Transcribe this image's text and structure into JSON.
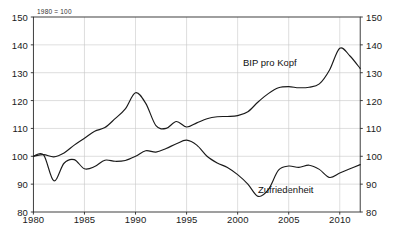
{
  "chart_data": {
    "type": "line",
    "title": "",
    "subtitle": "",
    "note": "1980 = 100",
    "xlabel": "",
    "ylabel": "",
    "xlim": [
      1980,
      2012
    ],
    "ylim": [
      80,
      150
    ],
    "grid": true,
    "legend": "inline-annotations",
    "x_ticks": [
      1980,
      1985,
      1990,
      1995,
      2000,
      2005,
      2010
    ],
    "x_tick_labels": [
      "1980",
      "1985",
      "1990",
      "1995",
      "2000",
      "2005",
      "2010"
    ],
    "y_ticks": [
      80,
      90,
      100,
      110,
      120,
      130,
      140,
      150
    ],
    "y_tick_labels_left": [
      "150",
      "140",
      "130",
      "120",
      "110",
      "100",
      "90",
      "80"
    ],
    "y_tick_labels_right": [
      "150",
      "140",
      "130",
      "120",
      "110",
      "100",
      "90",
      "80"
    ],
    "axis_color": "#2a2a2a",
    "grid_color": "#c8c8c8",
    "line_color": "#1a1a1a",
    "background": "#ffffff",
    "x": [
      1980,
      1981,
      1982,
      1983,
      1984,
      1985,
      1986,
      1987,
      1988,
      1989,
      1990,
      1991,
      1992,
      1993,
      1994,
      1995,
      1996,
      1997,
      1998,
      1999,
      2000,
      2001,
      2002,
      2003,
      2004,
      2005,
      2006,
      2007,
      2008,
      2009,
      2010,
      2011,
      2012
    ],
    "series": [
      {
        "name": "BIP pro Kopf",
        "label": "BIP pro Kopf",
        "label_x": 2003.1,
        "label_y": 131.5,
        "values": [
          100.0,
          100.6,
          99.8,
          101.2,
          104.0,
          106.5,
          109.0,
          110.3,
          113.5,
          117.0,
          122.8,
          119.0,
          111.0,
          110.0,
          112.5,
          110.5,
          112.0,
          113.5,
          114.2,
          114.3,
          114.6,
          116.0,
          119.5,
          122.5,
          124.6,
          125.0,
          124.6,
          124.8,
          126.0,
          131.0,
          138.8,
          136.0,
          131.5
        ]
      },
      {
        "name": "Zufriedenheit",
        "label": "Zufriedenheit",
        "label_x": 2004.3,
        "label_y": 86.5,
        "values": [
          100.0,
          100.5,
          91.2,
          97.5,
          98.8,
          95.5,
          96.3,
          98.6,
          98.2,
          98.5,
          100.0,
          102.0,
          101.5,
          102.8,
          104.5,
          105.8,
          104.0,
          100.0,
          97.6,
          96.0,
          93.4,
          90.0,
          85.6,
          88.0,
          95.0,
          96.5,
          96.0,
          96.8,
          95.3,
          92.4,
          94.0,
          95.5,
          97.0
        ]
      }
    ],
    "series_BIP_pro_Kopf_path_note": "Smooth rising curve: starts 100 in 1980, dips slightly 1982, rises steadily to 1990 reunification peak ~123, drops to ~110 by 1993, small recovery bump 1994 ~112, dip 1995 ~110.5, gradual climb through late 1990s, plateau ~114-115 around 1999-2001, rises to ~125 by 2004-2005, flat ~124-125 through 2007, rises sharply to peak ~140 in 2008, sharp crisis dip to ~132 in 2009, recovers steeply to ~142 by 2011-2012",
    "series_Zufriedenheit_path_note": "Starts 100 in 1980, sharp dip to ~91 in 1981-82, recovers to ~98.5, small dip ~95.5 in 1984, wobble ~96-98 to 1987, rises through late 1980s to ~100 in 1990, continues to peak ~106 in 1994, declines to ~99 by 1996, deep dip to ~85.5 in 1997, recovery to ~96-97 in 1998-1999, dip ~95 in 2000, bump ~97 2001, sharp drop to ~86 in 2003, sharp rise to ~100 in 2004, dip ~92.5 in 2005, rise to ~101 in 2006-2007, decline to ~97 in 2008-2010, rises to ~104.5 by 2012"
  },
  "figure": {
    "caption_strip": ""
  }
}
